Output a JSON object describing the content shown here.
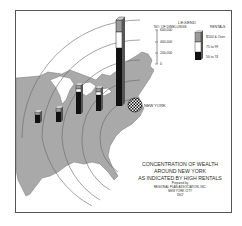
{
  "map": {
    "title_lines": [
      "CONCENTRATION OF WEALTH",
      "AROUND NEW YORK",
      "AS INDICATED BY HIGH RENTALS"
    ],
    "prepared_by": "Prepared by",
    "organization": "REGIONAL PLAN ASSOCIATION, INC.",
    "city": "NEW YORK CITY",
    "year": "1947",
    "center_label": "NEW YORK",
    "arc_labels": [
      "800 MILES",
      "600",
      "400",
      "200"
    ]
  },
  "legend": {
    "title": "LEGEND",
    "scale_title": "NO. OF DWELLINGS",
    "scale_ticks": [
      "600,000",
      "400,000",
      "200,000",
      "0"
    ],
    "rentals_title": "RENTALS",
    "categories": [
      {
        "label": "$100 & Over",
        "fill": "#9a9a9a"
      },
      {
        "label": "75 to 99",
        "fill": "#ffffff"
      },
      {
        "label": "50 to 74",
        "fill": "#111111"
      }
    ]
  },
  "colors": {
    "land": "#a9a9a9",
    "water": "#ffffff",
    "frame": "#555555",
    "bar_dark": "#111111",
    "bar_mid": "#ffffff",
    "bar_top": "#9a9a9a"
  }
}
